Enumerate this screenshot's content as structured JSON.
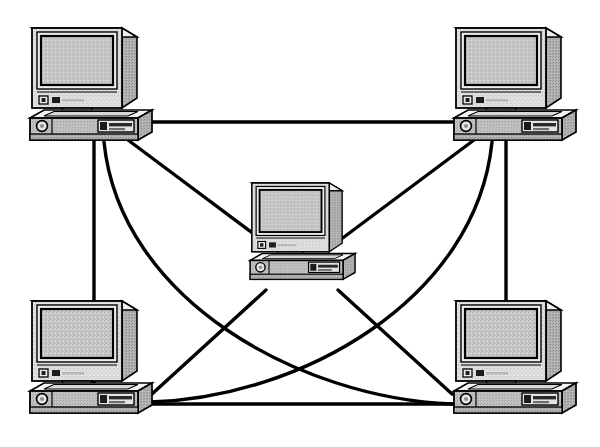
{
  "diagram": {
    "title": "Fully Meshed Computer Network Topology",
    "type": "network-topology-diagram",
    "style": "monochrome dithered clip-art line drawing",
    "canvas": {
      "width": 600,
      "height": 447,
      "background": "#ffffff"
    },
    "colors": {
      "outline": "#000000",
      "link_line": "#000000",
      "case_top_highlight": "#f2f2f2",
      "case_face": "#dcdcdc",
      "case_side_shadow": "#a8a8a8",
      "screen_fill": "#c4c4c4",
      "screen_bezel": "#e8e8e8",
      "dither_light": "#d2d2d2",
      "dither_dark": "#9a9a9a",
      "button_dark": "#202020"
    },
    "node_count": 5,
    "link_count": 10,
    "nodes": [
      {
        "id": "pc-top-left",
        "label": "Computer 1",
        "position": "top-left",
        "x": 88,
        "y": 85,
        "scale": 1.0,
        "port": {
          "x": 100,
          "y": 140
        }
      },
      {
        "id": "pc-top-right",
        "label": "Computer 2",
        "position": "top-right",
        "x": 512,
        "y": 85,
        "scale": 1.0,
        "port": {
          "x": 500,
          "y": 140
        }
      },
      {
        "id": "pc-center",
        "label": "Computer 3",
        "position": "center",
        "x": 300,
        "y": 232,
        "scale": 0.86,
        "port": {
          "x": 300,
          "y": 283
        }
      },
      {
        "id": "pc-bottom-left",
        "label": "Computer 4",
        "position": "bottom-left",
        "x": 88,
        "y": 358,
        "scale": 1.0,
        "port": {
          "x": 100,
          "y": 410
        }
      },
      {
        "id": "pc-bottom-right",
        "label": "Computer 5",
        "position": "bottom-right",
        "x": 512,
        "y": 358,
        "scale": 1.0,
        "port": {
          "x": 500,
          "y": 410
        }
      }
    ],
    "links": [
      {
        "id": "link-tl-tr",
        "from": "pc-top-left",
        "to": "pc-top-right",
        "shape": "straight",
        "d": "M 148 122 L 458 122"
      },
      {
        "id": "link-tl-bl",
        "from": "pc-top-left",
        "to": "pc-bottom-left",
        "shape": "straight",
        "d": "M 94 140 L 94 400"
      },
      {
        "id": "link-tl-center",
        "from": "pc-top-left",
        "to": "pc-center",
        "shape": "straight",
        "d": "M 128 140 L 258 238"
      },
      {
        "id": "link-tl-br",
        "from": "pc-top-left",
        "to": "pc-bottom-right",
        "shape": "curve",
        "d": "M 104 142 C 120 300 300 398 452 404"
      },
      {
        "id": "link-tr-br",
        "from": "pc-top-right",
        "to": "pc-bottom-right",
        "shape": "straight",
        "d": "M 506 140 L 506 400"
      },
      {
        "id": "link-tr-center",
        "from": "pc-top-right",
        "to": "pc-center",
        "shape": "straight",
        "d": "M 474 140 L 344 238"
      },
      {
        "id": "link-tr-bl",
        "from": "pc-top-right",
        "to": "pc-bottom-left",
        "shape": "curve",
        "d": "M 492 142 C 476 300 300 398 150 402"
      },
      {
        "id": "link-bl-br",
        "from": "pc-bottom-left",
        "to": "pc-bottom-right",
        "shape": "straight",
        "d": "M 148 404 L 458 404"
      },
      {
        "id": "link-center-bl",
        "from": "pc-center",
        "to": "pc-bottom-left",
        "shape": "straight",
        "d": "M 262 288 L 152 392"
      },
      {
        "id": "link-center-br",
        "from": "pc-center",
        "to": "pc-bottom-right",
        "shape": "straight",
        "d": "M 340 288 L 454 392"
      }
    ]
  }
}
